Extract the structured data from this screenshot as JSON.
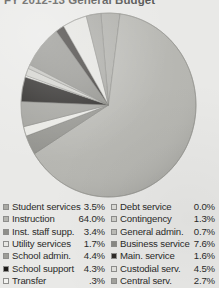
{
  "title": "FY 2012-13 General Budget",
  "background_color": "#e9e9e7",
  "chart_data": {
    "type": "pie",
    "title": "FY 2012-13 General Budget",
    "units": "percent of total budget",
    "legend_position": "bottom",
    "grid": false,
    "categories": [
      "Student services",
      "Instruction",
      "Inst. staff supp.",
      "Utility services",
      "School admin.",
      "School support",
      "Transfer",
      "Debt service",
      "Contingency",
      "General admin.",
      "Business service",
      "Main. service",
      "Custodial serv.",
      "Central serv."
    ],
    "values": [
      3.5,
      64.0,
      3.4,
      1.7,
      4.4,
      4.3,
      0.3,
      0.0,
      1.3,
      0.7,
      7.6,
      1.6,
      4.5,
      2.7
    ],
    "value_labels": [
      "3.5%",
      "64.0%",
      "3.4%",
      "1.7%",
      "4.4%",
      "4.3%",
      ".3%",
      "0.0%",
      "1.3%",
      "0.7%",
      "7.6%",
      "1.6%",
      "4.5%",
      "2.7%"
    ],
    "slice_colors": [
      "#a9a9a4",
      "#b5b5b0",
      "#8f8f8a",
      "#e7e7e3",
      "#9d9d98",
      "#1c1a18",
      "#f2f2ef",
      "#dcdcd8",
      "#cfcfca",
      "#bdbdb8",
      "#8a8a85",
      "#2e2b28",
      "#e1e1dd",
      "#a2a29d"
    ]
  },
  "legend": {
    "left_column": [
      {
        "label": "Student services",
        "value": "3.5%",
        "color": "#a9a9a4"
      },
      {
        "label": "Instruction",
        "value": "64.0%",
        "color": "#b5b5b0"
      },
      {
        "label": "Inst. staff supp.",
        "value": "3.4%",
        "color": "#8f8f8a"
      },
      {
        "label": "Utility services",
        "value": "1.7%",
        "color": "#e7e7e3"
      },
      {
        "label": "School admin.",
        "value": "4.4%",
        "color": "#9d9d98"
      },
      {
        "label": "School support",
        "value": "4.3%",
        "color": "#1c1a18"
      },
      {
        "label": "Transfer",
        "value": ".3%",
        "color": "#f2f2ef"
      }
    ],
    "right_column": [
      {
        "label": "Debt service",
        "value": "0.0%",
        "color": "#dcdcd8"
      },
      {
        "label": "Contingency",
        "value": "1.3%",
        "color": "#cfcfca"
      },
      {
        "label": "General admin.",
        "value": "0.7%",
        "color": "#bdbdb8"
      },
      {
        "label": "Business service",
        "value": "7.6%",
        "color": "#8a8a85"
      },
      {
        "label": "Main. service",
        "value": "1.6%",
        "color": "#2e2b28"
      },
      {
        "label": "Custodial serv.",
        "value": "4.5%",
        "color": "#e1e1dd"
      },
      {
        "label": "Central serv.",
        "value": "2.7%",
        "color": "#a2a29d"
      }
    ]
  }
}
